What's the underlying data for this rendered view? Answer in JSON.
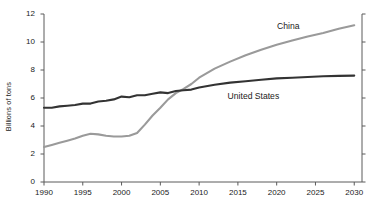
{
  "chart_data": {
    "type": "line",
    "title": "",
    "subtitle": "",
    "xlabel": "",
    "ylabel": "Billions of tons",
    "xlim": [
      1990,
      2031
    ],
    "ylim": [
      0,
      12
    ],
    "grid": false,
    "legend_position": "inline-annotation",
    "xticks": [
      "1990",
      "1995",
      "2000",
      "2005",
      "2010",
      "2015",
      "2020",
      "2025",
      "2030"
    ],
    "xtick_values": [
      1990,
      1995,
      2000,
      2005,
      2010,
      2015,
      2020,
      2025,
      2030
    ],
    "yticks": [
      "0",
      "2",
      "4",
      "6",
      "8",
      "10",
      "12"
    ],
    "ytick_values": [
      0,
      2,
      4,
      6,
      8,
      10,
      12
    ],
    "annotations": [
      {
        "text": "China",
        "x": 2021.5,
        "y": 11.05,
        "color": "#8c8c8c"
      },
      {
        "text": "United States",
        "x": 2017.0,
        "y": 6.1,
        "color": "#2b2b2b"
      }
    ],
    "series": [
      {
        "name": "China",
        "color": "#9a9a9a",
        "x": [
          1990,
          1991,
          1992,
          1993,
          1994,
          1995,
          1996,
          1997,
          1998,
          1999,
          2000,
          2001,
          2002,
          2003,
          2004,
          2005,
          2006,
          2007,
          2008,
          2009,
          2010,
          2012,
          2014,
          2016,
          2018,
          2020,
          2022,
          2024,
          2026,
          2028,
          2030
        ],
        "values": [
          2.5,
          2.65,
          2.8,
          2.95,
          3.1,
          3.3,
          3.45,
          3.4,
          3.3,
          3.25,
          3.25,
          3.3,
          3.5,
          4.1,
          4.75,
          5.3,
          5.9,
          6.35,
          6.65,
          7.0,
          7.45,
          8.1,
          8.6,
          9.05,
          9.45,
          9.8,
          10.1,
          10.4,
          10.65,
          10.95,
          11.2
        ]
      },
      {
        "name": "United States",
        "color": "#333333",
        "x": [
          1990,
          1991,
          1992,
          1993,
          1994,
          1995,
          1996,
          1997,
          1998,
          1999,
          2000,
          2001,
          2002,
          2003,
          2004,
          2005,
          2006,
          2007,
          2008,
          2009,
          2010,
          2012,
          2014,
          2016,
          2018,
          2020,
          2022,
          2024,
          2026,
          2028,
          2030
        ],
        "values": [
          5.3,
          5.3,
          5.4,
          5.45,
          5.5,
          5.6,
          5.6,
          5.75,
          5.8,
          5.9,
          6.1,
          6.05,
          6.2,
          6.2,
          6.3,
          6.4,
          6.35,
          6.5,
          6.55,
          6.6,
          6.75,
          6.95,
          7.1,
          7.2,
          7.3,
          7.4,
          7.45,
          7.5,
          7.55,
          7.58,
          7.6
        ]
      }
    ]
  }
}
